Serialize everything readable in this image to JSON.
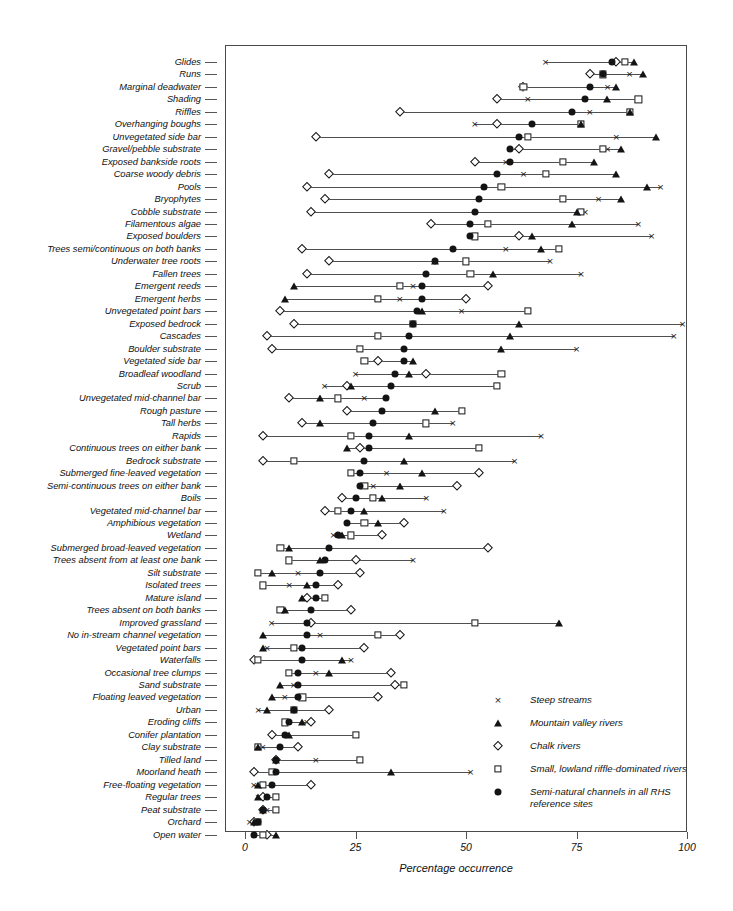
{
  "chart_data": {
    "type": "scatter",
    "title": "",
    "xlabel": "Percentage occurrence",
    "ylabel": "",
    "xlim": [
      0,
      100
    ],
    "xticks": [
      0,
      25,
      50,
      75,
      100
    ],
    "grid": false,
    "legend_position": "right-bottom-inside",
    "series_names": [
      "Steep streams",
      "Mountain valley rivers",
      "Chalk rivers",
      "Small, lowland riffle-dominated rivers",
      "Semi-natural channels in all RHS reference sites"
    ],
    "series_markers": [
      "cross",
      "triangle",
      "diamond",
      "square",
      "circle"
    ],
    "categories": [
      "Glides",
      "Runs",
      "Marginal deadwater",
      "Shading",
      "Riffles",
      "Overhanging boughs",
      "Unvegetated side bar",
      "Gravel/pebble substrate",
      "Exposed bankside roots",
      "Coarse woody debris",
      "Pools",
      "Bryophytes",
      "Cobble substrate",
      "Filamentous algae",
      "Exposed boulders",
      "Trees semi/continuous on both banks",
      "Underwater tree roots",
      "Fallen trees",
      "Emergent reeds",
      "Emergent herbs",
      "Unvegetated point bars",
      "Exposed bedrock",
      "Cascades",
      "Boulder substrate",
      "Vegetated side bar",
      "Broadleaf woodland",
      "Scrub",
      "Unvegetated mid-channel bar",
      "Rough pasture",
      "Tall herbs",
      "Rapids",
      "Continuous trees on either bank",
      "Bedrock substrate",
      "Submerged fine-leaved vegetation",
      "Semi-continuous trees on either bank",
      "Boils",
      "Vegetated mid-channel bar",
      "Amphibious vegetation",
      "Wetland",
      "Submerged broad-leaved vegetation",
      "Trees absent from at least one bank",
      "Silt substrate",
      "Isolated trees",
      "Mature island",
      "Trees absent on both banks",
      "Improved grassland",
      "No in-stream channel vegetation",
      "Vegetated point bars",
      "Waterfalls",
      "Occasional tree clumps",
      "Sand substrate",
      "Floating leaved vegetation",
      "Urban",
      "Eroding cliffs",
      "Conifer plantation",
      "Clay substrate",
      "Tilled land",
      "Moorland heath",
      "Free-floating vegetation",
      "Regular trees",
      "Peat substrate",
      "Orchard",
      "Open water"
    ],
    "series": [
      {
        "name": "Steep streams",
        "marker": "cross",
        "values": [
          68,
          87,
          82,
          64,
          78,
          52,
          84,
          82,
          59,
          63,
          94,
          80,
          77,
          89,
          92,
          59,
          69,
          76,
          38,
          35,
          49,
          99,
          97,
          75,
          36,
          25,
          18,
          27,
          31,
          47,
          67,
          28,
          61,
          32,
          29,
          41,
          45,
          27,
          20,
          19,
          38,
          12,
          10,
          18,
          8,
          6,
          17,
          5,
          24,
          16,
          11,
          9,
          3,
          14,
          9,
          4,
          16,
          51,
          2,
          3,
          5,
          1,
          2
        ]
      },
      {
        "name": "Mountain valley rivers",
        "marker": "triangle",
        "values": [
          88,
          90,
          84,
          82,
          87,
          76,
          93,
          85,
          79,
          84,
          91,
          85,
          75,
          74,
          65,
          67,
          43,
          56,
          11,
          9,
          40,
          62,
          60,
          58,
          38,
          37,
          24,
          17,
          43,
          17,
          37,
          23,
          36,
          40,
          35,
          31,
          27,
          30,
          22,
          10,
          17,
          6,
          14,
          13,
          9,
          71,
          4,
          4,
          22,
          19,
          8,
          6,
          5,
          13,
          10,
          3,
          7,
          33,
          3,
          3,
          4,
          2,
          7
        ]
      },
      {
        "name": "Chalk rivers",
        "marker": "diamond",
        "values": [
          84,
          78,
          63,
          57,
          35,
          57,
          16,
          62,
          52,
          19,
          14,
          18,
          15,
          42,
          62,
          13,
          19,
          14,
          55,
          50,
          8,
          11,
          5,
          6,
          30,
          41,
          23,
          10,
          23,
          13,
          4,
          26,
          4,
          53,
          48,
          22,
          18,
          36,
          31,
          55,
          25,
          26,
          21,
          14,
          24,
          15,
          35,
          27,
          2,
          33,
          34,
          30,
          19,
          15,
          6,
          12,
          7,
          2,
          15,
          4,
          4,
          2,
          5
        ]
      },
      {
        "name": "Small, lowland riffle-dominated rivers",
        "marker": "square",
        "values": [
          86,
          81,
          63,
          89,
          87,
          76,
          64,
          81,
          72,
          68,
          58,
          72,
          76,
          55,
          52,
          71,
          50,
          51,
          35,
          30,
          64,
          38,
          30,
          26,
          27,
          58,
          57,
          21,
          49,
          41,
          24,
          53,
          11,
          24,
          27,
          29,
          21,
          27,
          24,
          8,
          10,
          3,
          4,
          18,
          8,
          52,
          30,
          11,
          3,
          10,
          36,
          13,
          11,
          9,
          25,
          3,
          26,
          6,
          4,
          7,
          7,
          3,
          4
        ]
      },
      {
        "name": "Semi-natural channels in all RHS reference sites",
        "marker": "circle",
        "values": [
          83,
          81,
          78,
          77,
          74,
          65,
          62,
          60,
          60,
          57,
          54,
          53,
          52,
          51,
          51,
          47,
          43,
          41,
          40,
          40,
          39,
          38,
          37,
          36,
          36,
          34,
          33,
          32,
          31,
          29,
          28,
          28,
          27,
          26,
          26,
          25,
          24,
          23,
          21,
          19,
          18,
          17,
          16,
          16,
          15,
          14,
          14,
          13,
          13,
          12,
          12,
          12,
          11,
          10,
          9,
          8,
          7,
          7,
          6,
          5,
          4,
          3,
          2
        ]
      }
    ]
  },
  "axis": {
    "x_tick_labels": [
      "0",
      "25",
      "50",
      "75",
      "100"
    ],
    "x_title": "Percentage occurrence"
  },
  "legend": {
    "items": [
      {
        "marker": "cross",
        "label": "Steep streams",
        "label2": ""
      },
      {
        "marker": "triangle",
        "label": "Mountain valley rivers",
        "label2": ""
      },
      {
        "marker": "diamond",
        "label": "Chalk rivers",
        "label2": ""
      },
      {
        "marker": "square",
        "label": "Small, lowland riffle-dominated rivers",
        "label2": ""
      },
      {
        "marker": "circle",
        "label": "Semi-natural channels in all RHS",
        "label2": "reference sites"
      }
    ]
  },
  "colors": {
    "marker": "#141414",
    "line": "#4f4f4f",
    "frame": "#4a4a4a",
    "background": "#ffffff"
  }
}
